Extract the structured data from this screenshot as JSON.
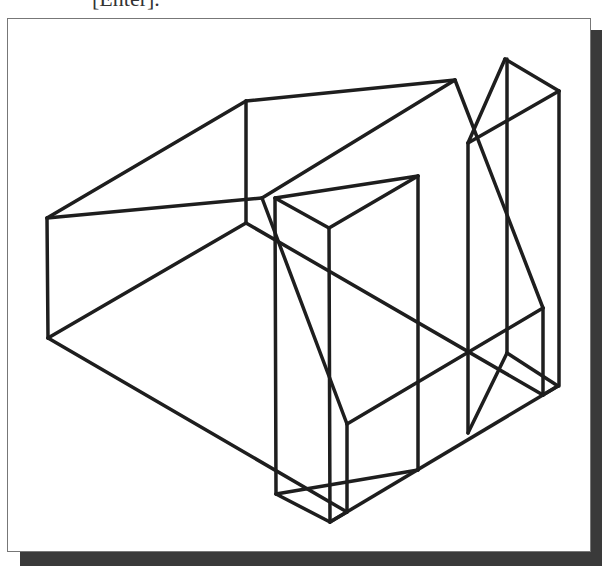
{
  "caption": {
    "text": "[Enter]."
  },
  "figure": {
    "frame": {
      "x": 7,
      "y": 18,
      "width": 584,
      "height": 534
    },
    "shadow_color": "#3a3a3a",
    "line_color": "#1e1e1e",
    "stroke_width": 3.5,
    "edges": [
      [
        47,
        218,
        246,
        101
      ],
      [
        246,
        101,
        455,
        80
      ],
      [
        246,
        101,
        246,
        223
      ],
      [
        47,
        218,
        262,
        198
      ],
      [
        262,
        198,
        455,
        80
      ],
      [
        47,
        218,
        48,
        338
      ],
      [
        48,
        338,
        246,
        223
      ],
      [
        48,
        338,
        347,
        512
      ],
      [
        262,
        198,
        347,
        424
      ],
      [
        246,
        223,
        543,
        395
      ],
      [
        275,
        198,
        418,
        176
      ],
      [
        275,
        198,
        329,
        228
      ],
      [
        329,
        228,
        418,
        176
      ],
      [
        275,
        198,
        276,
        494
      ],
      [
        329,
        228,
        330,
        522
      ],
      [
        418,
        176,
        418,
        470
      ],
      [
        276,
        494,
        330,
        522
      ],
      [
        330,
        522,
        347,
        512
      ],
      [
        276,
        494,
        418,
        470
      ],
      [
        347,
        424,
        347,
        512
      ],
      [
        347,
        424,
        543,
        308
      ],
      [
        330,
        522,
        558,
        386
      ],
      [
        455,
        80,
        543,
        308
      ],
      [
        543,
        308,
        543,
        395
      ],
      [
        468,
        143,
        505,
        59
      ],
      [
        505,
        59,
        559,
        91
      ],
      [
        468,
        143,
        559,
        91
      ],
      [
        468,
        143,
        468,
        433
      ],
      [
        507,
        59,
        507,
        353
      ],
      [
        559,
        91,
        559,
        386
      ],
      [
        468,
        433,
        507,
        353
      ],
      [
        507,
        353,
        558,
        386
      ],
      [
        543,
        395,
        558,
        386
      ]
    ]
  }
}
